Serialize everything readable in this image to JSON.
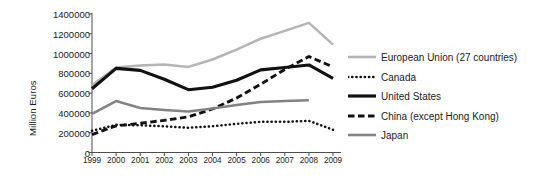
{
  "axis": {
    "ylabel": "Million Euros",
    "yticks": [
      "1400000",
      "1200000",
      "1000000",
      "800000",
      "600000",
      "400000",
      "200000",
      "0"
    ],
    "xticks": [
      "1999",
      "2000",
      "2001",
      "2002",
      "2003",
      "2004",
      "2005",
      "2006",
      "2007",
      "2008",
      "2009"
    ]
  },
  "legend": [
    {
      "label": "European Union (27 countries)",
      "style": "solid",
      "color": "#b4b4b4",
      "width": 2.6,
      "key": "legend-key-european-union"
    },
    {
      "label": "Canada",
      "style": "dotted",
      "color": "#111111",
      "width": 2.6,
      "key": "legend-key-canada"
    },
    {
      "label": "United States",
      "style": "solid",
      "color": "#111111",
      "width": 3.2,
      "key": "legend-key-united-states"
    },
    {
      "label": "China (except Hong Kong)",
      "style": "dashed",
      "color": "#111111",
      "width": 3.0,
      "key": "legend-key-china"
    },
    {
      "label": "Japan",
      "style": "solid",
      "color": "#838383",
      "width": 2.6,
      "key": "legend-key-japan"
    }
  ],
  "chart_data": {
    "type": "line",
    "title": "",
    "xlabel": "",
    "ylabel": "Million Euros",
    "x": [
      1999,
      2000,
      2001,
      2002,
      2003,
      2004,
      2005,
      2006,
      2007,
      2008,
      2009
    ],
    "ylim": [
      0,
      1400000
    ],
    "yticks": [
      0,
      200000,
      400000,
      600000,
      800000,
      1000000,
      1200000,
      1400000
    ],
    "grid": false,
    "legend_position": "right",
    "series": [
      {
        "name": "European Union (27 countries)",
        "style": "solid",
        "color": "#b4b4b4",
        "values": [
          680000,
          860000,
          880000,
          890000,
          865000,
          940000,
          1040000,
          1150000,
          1230000,
          1310000,
          1090000
        ]
      },
      {
        "name": "Canada",
        "style": "dotted",
        "color": "#111111",
        "values": [
          220000,
          280000,
          275000,
          265000,
          250000,
          265000,
          290000,
          310000,
          310000,
          320000,
          230000
        ]
      },
      {
        "name": "United States",
        "style": "solid",
        "color": "#111111",
        "values": [
          645000,
          850000,
          830000,
          740000,
          635000,
          660000,
          730000,
          835000,
          860000,
          885000,
          750000
        ]
      },
      {
        "name": "China (except Hong Kong)",
        "style": "dashed",
        "color": "#111111",
        "values": [
          180000,
          270000,
          295000,
          325000,
          360000,
          440000,
          550000,
          690000,
          840000,
          970000,
          865000
        ]
      },
      {
        "name": "Japan",
        "style": "solid",
        "color": "#838383",
        "values": [
          390000,
          520000,
          450000,
          430000,
          415000,
          445000,
          480000,
          510000,
          520000,
          528000,
          null
        ]
      }
    ]
  }
}
